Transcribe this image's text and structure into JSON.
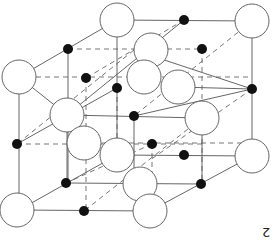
{
  "figure": {
    "type": "crystal-lattice",
    "label": "2",
    "colors": {
      "large_ion": "#ffffff",
      "small_ion": "#111111",
      "bond": "#555555"
    }
  }
}
